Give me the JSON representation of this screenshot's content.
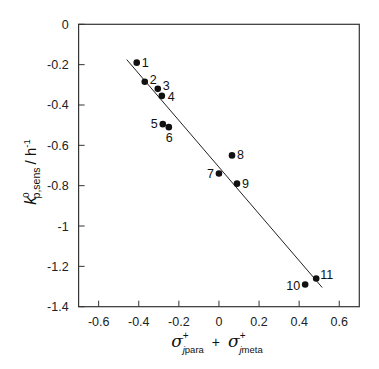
{
  "chart_data": {
    "type": "scatter",
    "title": "",
    "xlabel": "σ⁺(j,para) + σ⁺(j,meta)",
    "ylabel": "k⁰(p,sens) / h⁻¹",
    "xlabel_parts": {
      "term1_symbol": "σ",
      "term1_sup": "+",
      "term1_sub_italic": "j",
      "term1_sub": "para",
      "operator": "+",
      "term2_symbol": "σ",
      "term2_sup": "+",
      "term2_sub_italic": "j",
      "term2_sub": "meta"
    },
    "ylabel_parts": {
      "symbol": "k",
      "sup": "0",
      "sub": "p,sens",
      "unit_prefix": "/ h",
      "unit_sup": "-1"
    },
    "xlim": [
      -0.7,
      0.7
    ],
    "ylim": [
      -1.4,
      0
    ],
    "xticks": [
      -0.6,
      -0.4,
      -0.2,
      0,
      0.2,
      0.4,
      0.6
    ],
    "xtick_labels": [
      "-0.6",
      "-0.4",
      "-0.2",
      "0",
      "0.2",
      "0.4",
      "0.6"
    ],
    "yticks": [
      0,
      -0.2,
      -0.4,
      -0.6,
      -0.8,
      -1,
      -1.2,
      -1.4
    ],
    "ytick_labels": [
      "0",
      "-0.2",
      "-0.4",
      "-0.6",
      "-0.8",
      "-1",
      "-1.2",
      "-1.4"
    ],
    "grid": false,
    "legend": null,
    "series": [
      {
        "name": "data",
        "points": [
          {
            "label": "1",
            "x": -0.41,
            "y": -0.19
          },
          {
            "label": "2",
            "x": -0.37,
            "y": -0.285
          },
          {
            "label": "3",
            "x": -0.305,
            "y": -0.32
          },
          {
            "label": "4",
            "x": -0.285,
            "y": -0.355
          },
          {
            "label": "5",
            "x": -0.28,
            "y": -0.495
          },
          {
            "label": "6",
            "x": -0.25,
            "y": -0.51
          },
          {
            "label": "7",
            "x": 0.0,
            "y": -0.74
          },
          {
            "label": "8",
            "x": 0.065,
            "y": -0.65
          },
          {
            "label": "9",
            "x": 0.09,
            "y": -0.79
          },
          {
            "label": "10",
            "x": 0.43,
            "y": -1.29
          },
          {
            "label": "11",
            "x": 0.485,
            "y": -1.26
          }
        ]
      }
    ],
    "fit_line": {
      "x": [
        -0.46,
        0.515
      ],
      "y": [
        -0.175,
        -1.305
      ]
    }
  },
  "colors": {
    "axis": "#333333",
    "marker": "#111111",
    "fit_line": "#222222",
    "text": "#222222"
  }
}
